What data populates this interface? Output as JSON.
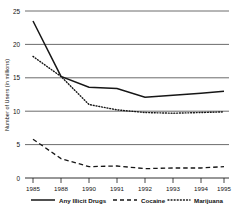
{
  "chart_data": {
    "type": "line",
    "title": "",
    "xlabel": "",
    "ylabel": "Number of Users (in millions)",
    "x": [
      1985,
      1988,
      1990,
      1991,
      1992,
      1993,
      1994,
      1995
    ],
    "categories": [
      "1985",
      "1988",
      "1990",
      "1991",
      "1992",
      "1993",
      "1994",
      "1995"
    ],
    "xlim": [
      1985,
      1995
    ],
    "ylim": [
      0,
      25
    ],
    "yticks": [
      0,
      5,
      10,
      15,
      20,
      25
    ],
    "ytick_labels": [
      "0",
      "5",
      "10",
      "15",
      "20",
      "25"
    ],
    "grid": true,
    "grid_axis": "y",
    "legend_position": "bottom",
    "series": [
      {
        "name": "Any Illicit Drugs",
        "style": "solid",
        "color": "#161616",
        "values": [
          23.5,
          15.2,
          13.6,
          13.4,
          12.1,
          12.4,
          12.7,
          13.0
        ]
      },
      {
        "name": "Cocaine",
        "style": "dashed",
        "color": "#161616",
        "values": [
          5.8,
          2.9,
          1.7,
          1.8,
          1.4,
          1.5,
          1.5,
          1.7
        ]
      },
      {
        "name": "Marijuana",
        "style": "dotted",
        "color": "#161616",
        "values": [
          18.2,
          15.2,
          11.0,
          10.2,
          9.8,
          9.7,
          9.8,
          9.9
        ]
      }
    ]
  },
  "axes": {
    "y_axis_title": "Number of Users (in millions)",
    "y_tick_labels": [
      "25",
      "20",
      "15",
      "10",
      "5",
      "0"
    ],
    "x_tick_labels": [
      "1985",
      "1988",
      "1990",
      "1991",
      "1992",
      "1993",
      "1994",
      "1995"
    ]
  },
  "legend": {
    "items": [
      {
        "label": "Any Illicit Drugs",
        "style": "solid"
      },
      {
        "label": "Cocaine",
        "style": "dashed"
      },
      {
        "label": "Marijuana",
        "style": "dotted"
      }
    ]
  }
}
